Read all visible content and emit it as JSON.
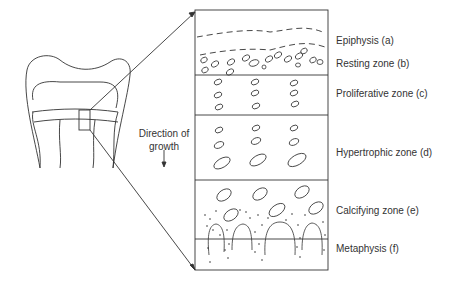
{
  "diagram": {
    "direction_label_line1": "Direction of",
    "direction_label_line2": "growth",
    "zones": [
      {
        "label": "Epiphysis (a)",
        "y": 49
      },
      {
        "label": "Resting zone (b)",
        "y": 70
      },
      {
        "label": "Proliferative zone (c)",
        "y": 99
      },
      {
        "label": "Hypertrophic zone (d)",
        "y": 157
      },
      {
        "label": "Calcifying zone (e)",
        "y": 216
      },
      {
        "label": "Metaphysis (f)",
        "y": 254
      }
    ],
    "colors": {
      "stroke": "#333333",
      "text": "#333333",
      "background": "#ffffff"
    }
  }
}
